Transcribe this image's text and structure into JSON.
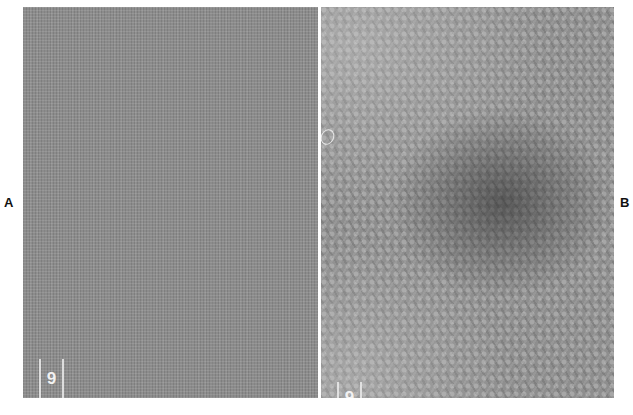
{
  "figure": {
    "panels": [
      {
        "label": "A",
        "description": "uniform fine grid texture micrograph",
        "marker_text": "6",
        "base_color": "#8c8c8c"
      },
      {
        "label": "B",
        "description": "periodic lattice micrograph with dark central region",
        "marker_text": "6",
        "base_color": "#8e8e8e"
      }
    ],
    "divider_color": "#ffffff"
  }
}
